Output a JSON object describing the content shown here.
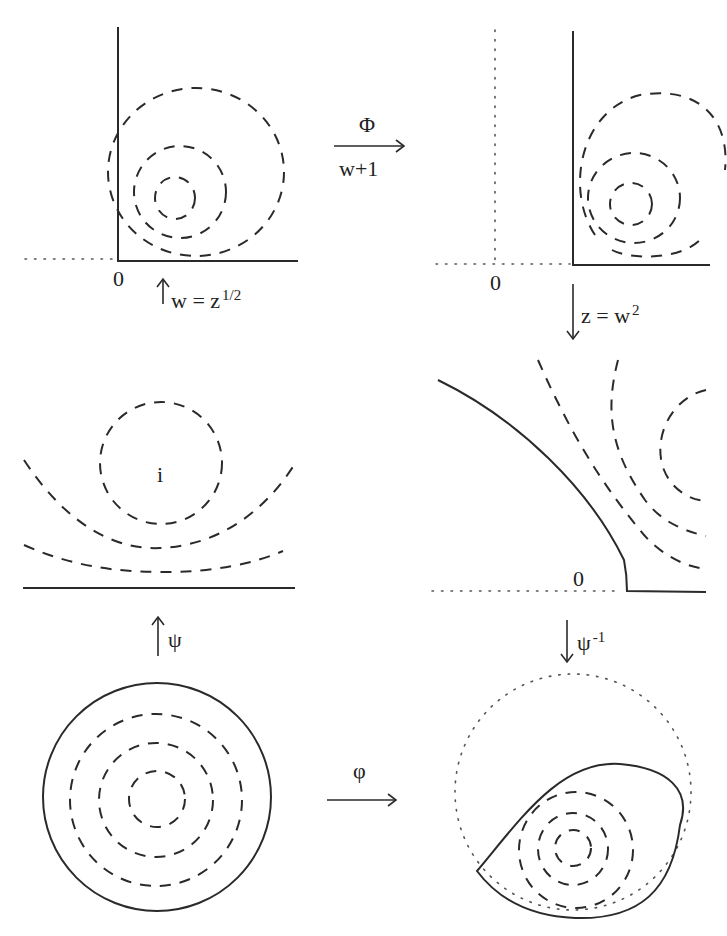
{
  "panels": {
    "top_left": {
      "origin_label": "0"
    },
    "top_right": {
      "origin_label": "0"
    },
    "middle_left": {
      "center_label": "i"
    },
    "middle_right": {
      "origin_label": "0"
    }
  },
  "arrows": {
    "phi_map": {
      "label_top": "Φ",
      "label_bottom": "w+1"
    },
    "sqrt_map": {
      "label_main": "w = z",
      "label_sup": "1/2"
    },
    "square_map": {
      "label_main": "z = w",
      "label_sup": "2"
    },
    "psi_map": {
      "label_main": "ψ"
    },
    "psi_inv_map": {
      "label_main": "ψ",
      "label_sup": "-1"
    },
    "varphi_map": {
      "label_top": "φ"
    }
  }
}
